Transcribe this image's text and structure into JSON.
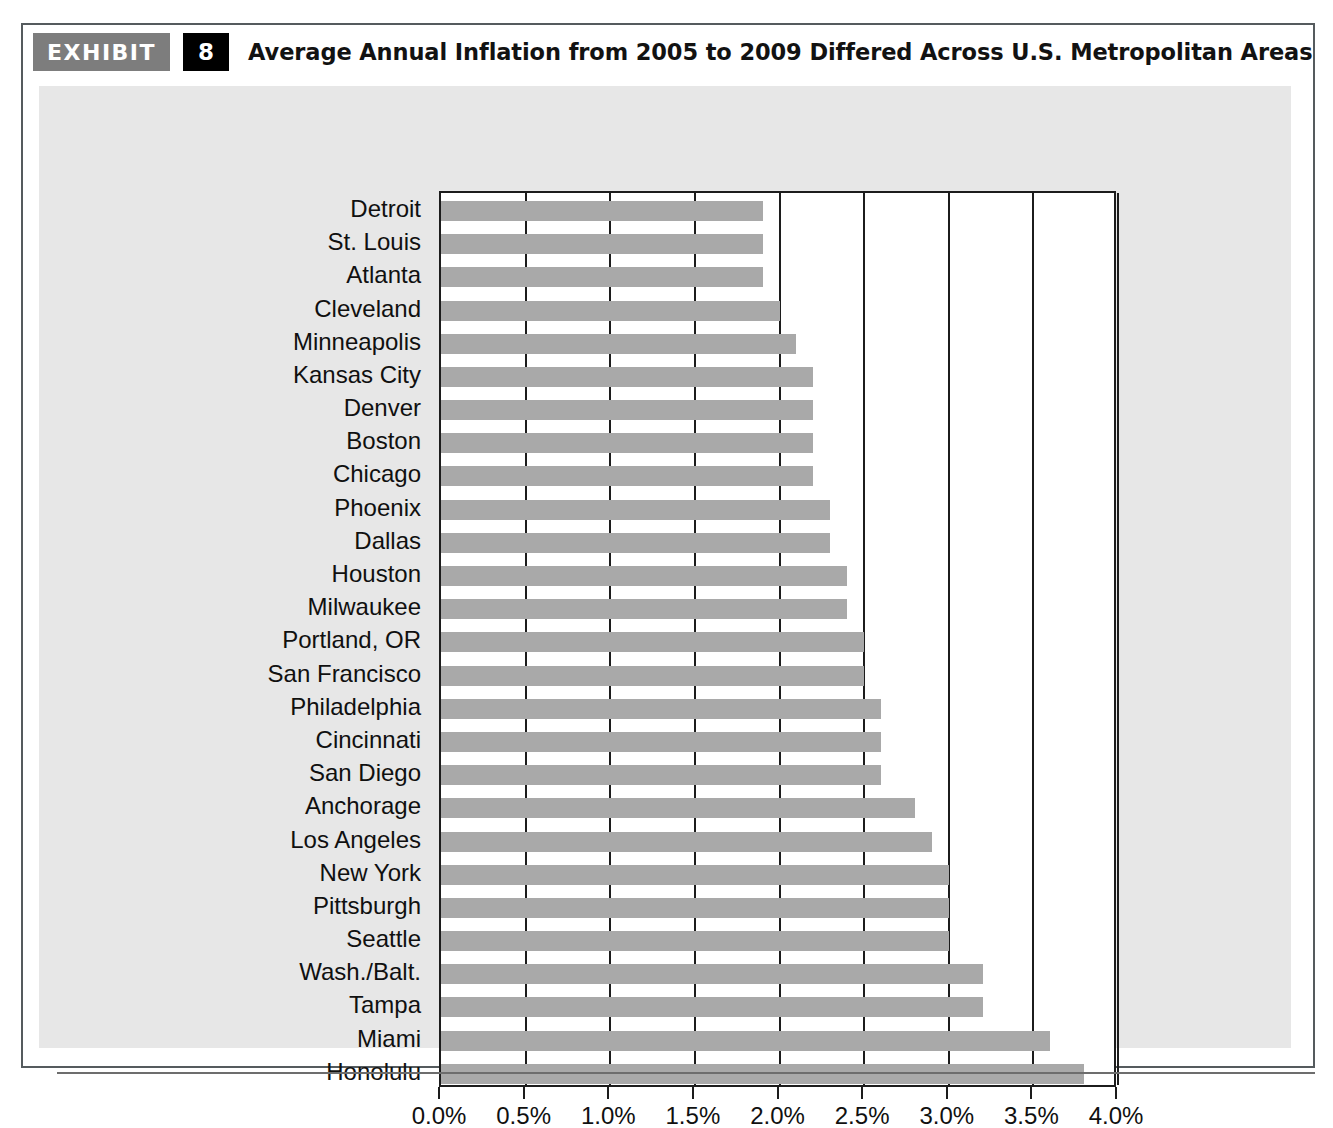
{
  "exhibit": {
    "tag_label": "EXHIBIT",
    "number": "8",
    "title": "Average Annual Inflation from 2005 to 2009 Differed Across U.S. Metropolitan Areas"
  },
  "colors": {
    "bar": "#a9a9a9",
    "panel_background": "#e7e7e7",
    "plot_background": "#ffffff",
    "axis": "#1c1c1c",
    "tag_background": "#7d7d7d",
    "number_background": "#000000",
    "frame_border": "#555b5e"
  },
  "chart_data": {
    "type": "bar",
    "orientation": "horizontal",
    "title": "Average Annual Inflation from 2005 to 2009 Differed Across U.S. Metropolitan Areas",
    "xlabel": "",
    "ylabel": "",
    "xlim": [
      0,
      4
    ],
    "xticks": [
      0,
      0.5,
      1,
      1.5,
      2,
      2.5,
      3,
      3.5,
      4
    ],
    "xtick_labels": [
      "0.0%",
      "0.5%",
      "1.0%",
      "1.5%",
      "2.0%",
      "2.5%",
      "3.0%",
      "3.5%",
      "4.0%"
    ],
    "grid": true,
    "legend": false,
    "units": "percent",
    "categories": [
      "Detroit",
      "St. Louis",
      "Atlanta",
      "Cleveland",
      "Minneapolis",
      "Kansas City",
      "Denver",
      "Boston",
      "Chicago",
      "Phoenix",
      "Dallas",
      "Houston",
      "Milwaukee",
      "Portland, OR",
      "San Francisco",
      "Philadelphia",
      "Cincinnati",
      "San Diego",
      "Anchorage",
      "Los Angeles",
      "New York",
      "Pittsburgh",
      "Seattle",
      "Wash./Balt.",
      "Tampa",
      "Miami",
      "Honolulu"
    ],
    "values": [
      1.9,
      1.9,
      1.9,
      2.0,
      2.1,
      2.2,
      2.2,
      2.2,
      2.2,
      2.3,
      2.3,
      2.4,
      2.4,
      2.5,
      2.5,
      2.6,
      2.6,
      2.6,
      2.8,
      2.9,
      3.0,
      3.0,
      3.0,
      3.2,
      3.2,
      3.6,
      3.8
    ]
  }
}
